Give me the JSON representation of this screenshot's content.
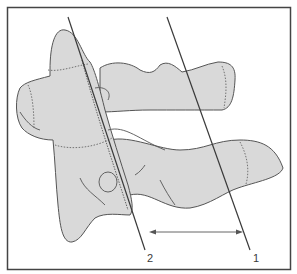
{
  "figure": {
    "colors": {
      "bone_fill": "#d9d9d9",
      "outline": "#555555",
      "line": "#3a3a3a",
      "frame": "#444444",
      "background": "#ffffff"
    },
    "lines": [
      {
        "id": "line-2",
        "label": "2"
      },
      {
        "id": "line-1",
        "label": "1"
      }
    ],
    "arrow": {
      "type": "double-headed",
      "between": [
        "2",
        "1"
      ]
    }
  }
}
